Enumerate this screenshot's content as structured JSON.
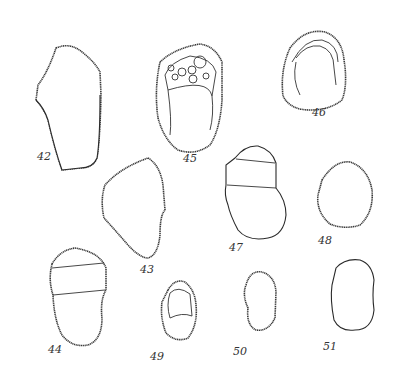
{
  "plate": {
    "background": "#ffffff",
    "ink_color": "#2a2a2a",
    "figures": [
      {
        "id": "42",
        "label": "42",
        "x": 37,
        "y": 160
      },
      {
        "id": "43",
        "label": "43",
        "x": 140,
        "y": 263
      },
      {
        "id": "44",
        "label": "44",
        "x": 50,
        "y": 346
      },
      {
        "id": "45",
        "label": "45",
        "x": 183,
        "y": 157
      },
      {
        "id": "46",
        "label": "46",
        "x": 313,
        "y": 110
      },
      {
        "id": "47",
        "label": "47",
        "x": 229,
        "y": 243
      },
      {
        "id": "48",
        "label": "48",
        "x": 318,
        "y": 235
      },
      {
        "id": "49",
        "label": "49",
        "x": 150,
        "y": 358
      },
      {
        "id": "50",
        "label": "50",
        "x": 234,
        "y": 353
      },
      {
        "id": "51",
        "label": "51",
        "x": 323,
        "y": 340
      }
    ]
  }
}
